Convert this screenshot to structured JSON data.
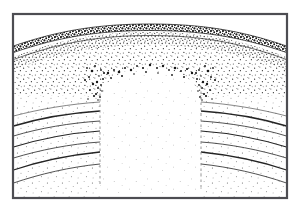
{
  "figure": {
    "name": "geologic-cross-section",
    "title": "Geologic Cross Section",
    "background_color": "#ffffff",
    "ink_color": "#1a1a1a"
  },
  "frame": {
    "name": "plate-border",
    "x": 12,
    "y": 13,
    "width": 276,
    "height": 186,
    "stroke_color": "#4d4d52",
    "stroke_width": 2.2
  },
  "units": [
    {
      "id": "cap-bed",
      "label": "Dark stippled cap bed",
      "fill": "#2b2b2b",
      "pattern": "dense-stipple",
      "crest_y": 25,
      "flank_y": 46,
      "thickness": 5
    },
    {
      "id": "upper-marker-bed",
      "label": "Thin marker bed beneath cap",
      "fill": "none",
      "pattern": "line-pair",
      "crest_y": 33,
      "flank_y": 54
    },
    {
      "id": "sandstone-body",
      "label": "Stippled sandstone body",
      "fill": "#ffffff",
      "pattern": "medium-stipple",
      "crest_y": 36,
      "flank_y": 58,
      "base_crest_y": 64,
      "base_flank_y": 108
    },
    {
      "id": "core-dome",
      "label": "Pale central core",
      "fill": "#ffffff",
      "pattern": "sparse-stipple",
      "apex_y": 66,
      "left_edge_x": 100,
      "right_edge_x": 200
    },
    {
      "id": "bedded-flanks",
      "label": "Curved bedded strata on flanks",
      "fill": "#ffffff",
      "pattern": "sparse-stipple-with-beds",
      "bed_count": 6
    }
  ],
  "contacts": [
    {
      "id": "contact-cap-top",
      "label": "Top of cap bed",
      "crest_y": 24,
      "flank_y": 45
    },
    {
      "id": "contact-cap-base",
      "label": "Base of cap bed",
      "crest_y": 31,
      "flank_y": 52
    },
    {
      "id": "contact-marker",
      "label": "Marker bed contact",
      "crest_y": 37,
      "flank_y": 59
    },
    {
      "id": "contact-sand-base",
      "label": "Base of sandstone",
      "crest_y": 63,
      "flank_y": 107
    }
  ],
  "faults": [
    {
      "id": "fault-left",
      "label": "Left fault trace",
      "x": 100,
      "y_top": 88,
      "y_bottom": 186,
      "style": "dashed"
    },
    {
      "id": "fault-right",
      "label": "Right fault trace",
      "x": 201,
      "y_top": 86,
      "y_bottom": 190,
      "style": "dashed"
    }
  ],
  "bedding_planes": [
    {
      "id": "bed-1",
      "left_y": 118,
      "right_y": 118,
      "edge_drop": 10
    },
    {
      "id": "bed-2",
      "left_y": 128,
      "right_y": 128,
      "edge_drop": 12
    },
    {
      "id": "bed-3",
      "left_y": 139,
      "right_y": 139,
      "edge_drop": 14
    },
    {
      "id": "bed-4",
      "left_y": 150,
      "right_y": 150,
      "edge_drop": 16
    },
    {
      "id": "bed-5",
      "left_y": 162,
      "right_y": 162,
      "edge_drop": 18
    },
    {
      "id": "bed-6",
      "left_y": 174,
      "right_y": 174,
      "edge_drop": 20
    }
  ],
  "ragged_contacts": [
    {
      "id": "ragged-left",
      "label": "Ragged left core contact",
      "x": 100
    },
    {
      "id": "ragged-right",
      "label": "Ragged right core contact",
      "x": 200
    }
  ]
}
